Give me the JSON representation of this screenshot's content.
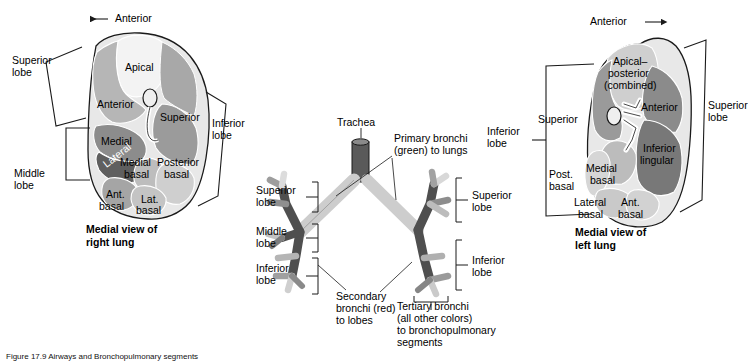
{
  "figure": {
    "caption": "Figure 17.9 Airways and Bronchopulmonary segments"
  },
  "panels": {
    "right_lung": {
      "title_line1": "Medial view of",
      "title_line2": "right lung",
      "direction_label": "Anterior",
      "direction_arrow": "arrow-left-icon",
      "lobes": [
        {
          "line1": "Superior",
          "line2": "lobe"
        },
        {
          "line1": "Middle",
          "line2": "lobe"
        },
        {
          "line1": "Inferior",
          "line2": "lobe"
        }
      ],
      "segments": [
        {
          "name": "Apical",
          "shade": "#f2f2f2"
        },
        {
          "name": "Anterior",
          "shade": "#b4b4b4"
        },
        {
          "name": "Superior",
          "shade": "#9c9c9c"
        },
        {
          "name": "Medial",
          "shade": "#8e8e8e"
        },
        {
          "name": "Lateral",
          "shade": "#6e6e6e"
        },
        {
          "name": "Medial\nbasal",
          "shade": "#bdbdbd"
        },
        {
          "name": "Posterior\nbasal",
          "shade": "#cfcfcf"
        },
        {
          "name": "Ant.\nbasal",
          "shade": "#a8a8a8"
        },
        {
          "name": "Lat.\nbasal",
          "shade": "#c6c6c6"
        }
      ],
      "segment_labels": {
        "apical": "Apical",
        "anterior": "Anterior",
        "superior": "Superior",
        "medial": "Medial",
        "lateral": "Lateral",
        "medial_basal_l1": "Medial",
        "medial_basal_l2": "basal",
        "posterior_basal_l1": "Posterior",
        "posterior_basal_l2": "basal",
        "ant_basal_l1": "Ant.",
        "ant_basal_l2": "basal",
        "lat_basal_l1": "Lat.",
        "lat_basal_l2": "basal"
      }
    },
    "bronchial_tree": {
      "trachea": "Trachea",
      "primary_bronchi_l1": "Primary bronchi",
      "primary_bronchi_l2": "(green) to lungs",
      "secondary_bronchi_l1": "Secondary",
      "secondary_bronchi_l2": "bronchi (red)",
      "secondary_bronchi_l3": "to lobes",
      "tertiary_bronchi_l1": "Tertiary bronchi",
      "tertiary_bronchi_l2": "(all other colors)",
      "tertiary_bronchi_l3": "to bronchopulmonary",
      "tertiary_bronchi_l4": "segments",
      "left_brackets": [
        {
          "line1": "Superior",
          "line2": "lobe"
        },
        {
          "line1": "Middle",
          "line2": "lobe"
        },
        {
          "line1": "Inferior",
          "line2": "lobe"
        }
      ],
      "right_brackets": [
        {
          "line1": "Superior",
          "line2": "lobe"
        },
        {
          "line1": "Inferior",
          "line2": "lobe"
        }
      ]
    },
    "left_lung": {
      "title_line1": "Medial view of",
      "title_line2": "left lung",
      "direction_label": "Anterior",
      "direction_arrow": "arrow-right-icon",
      "lobes": [
        {
          "line1": "Superior",
          "line2": "lobe"
        },
        {
          "line1": "Inferior",
          "line2": "lobe"
        }
      ],
      "segments": [
        {
          "name": "Apical–posterior (combined)",
          "shade": "#cfcfcf"
        },
        {
          "name": "Anterior",
          "shade": "#8e8e8e"
        },
        {
          "name": "Superior",
          "shade": "#9a9a9a"
        },
        {
          "name": "Inferior lingular",
          "shade": "#7a7a7a"
        },
        {
          "name": "Medial basal",
          "shade": "#bdbdbd"
        },
        {
          "name": "Post. basal",
          "shade": "#d6d6d6"
        },
        {
          "name": "Lateral basal",
          "shade": "#c9c9c9"
        },
        {
          "name": "Ant. basal",
          "shade": "#d2d2d2"
        }
      ],
      "segment_labels": {
        "apical_l1": "Apical–",
        "apical_l2": "posterior",
        "apical_l3": "(combined)",
        "anterior": "Anterior",
        "superior": "Superior",
        "inferior_lingular_l1": "Inferior",
        "inferior_lingular_l2": "lingular",
        "medial_basal_l1": "Medial",
        "medial_basal_l2": "basal",
        "post_basal_l1": "Post.",
        "post_basal_l2": "basal",
        "lateral_basal_l1": "Lateral",
        "lateral_basal_l2": "basal",
        "ant_basal_l1": "Ant.",
        "ant_basal_l2": "basal"
      }
    }
  },
  "colors": {
    "outline": "#1a1a1a",
    "bracket": "#1a1a1a",
    "leader": "#1a1a1a",
    "bronchi_dark": "#4a4a4a",
    "bronchi_mid": "#6f6f6f",
    "bronchi_light": "#c9c9c9",
    "bronchi_pale": "#e0e0e0"
  }
}
